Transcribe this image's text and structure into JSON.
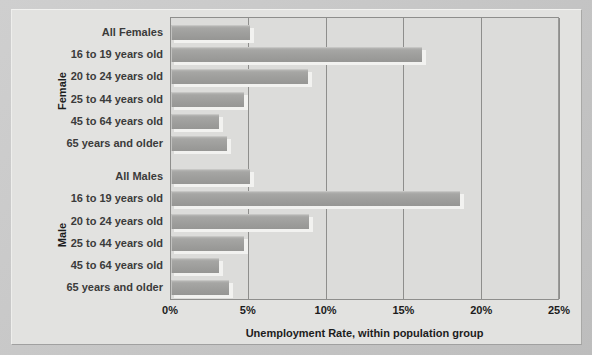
{
  "chart_data": {
    "type": "bar",
    "orientation": "horizontal",
    "title": "",
    "xlabel": "Unemployment Rate, within population group",
    "ylabel": "",
    "xlim": [
      0,
      25
    ],
    "xticks": [
      "0%",
      "5%",
      "10%",
      "15%",
      "20%",
      "25%"
    ],
    "xtick_values": [
      0,
      5,
      10,
      15,
      20,
      25
    ],
    "grid": true,
    "legend": "none",
    "groups": [
      {
        "name": "Female",
        "categories": [
          "All Females",
          "16 to 19 years old",
          "20 to 24 years old",
          "25 to 44 years old",
          "45 to 64 years old",
          "65 years and older"
        ],
        "values": [
          5.1,
          16.1,
          8.8,
          4.7,
          3.1,
          3.6
        ]
      },
      {
        "name": "Male",
        "categories": [
          "All Males",
          "16 to 19 years old",
          "20 to 24 years old",
          "25 to 44 years old",
          "45 to 64 years old",
          "65 years and older"
        ],
        "values": [
          5.1,
          18.6,
          8.9,
          4.7,
          3.1,
          3.7
        ]
      }
    ],
    "colors": {
      "bar": "#9e9e9c",
      "plot_background": "#dcdcda",
      "frame_background": "#e2e2e0",
      "axis": "#8e8e8c",
      "text": "#1c1c1c"
    }
  }
}
